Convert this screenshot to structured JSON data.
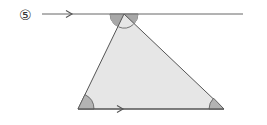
{
  "problem": {
    "number_label": "⑤"
  },
  "diagram": {
    "line_color": "#555555",
    "triangle_fill": "#e6e6e6",
    "angle_fill": "#b3b3b3",
    "angle_fill_light": "#cfcfcf",
    "top_line": {
      "x1": 42,
      "y1": 14,
      "x2": 243,
      "y2": 14
    },
    "apex": {
      "x": 124,
      "y": 14
    },
    "bottom_left": {
      "x": 78,
      "y": 109
    },
    "bottom_right": {
      "x": 224,
      "y": 109
    },
    "parallel_arrows": [
      "top-line",
      "bottom-side"
    ]
  }
}
